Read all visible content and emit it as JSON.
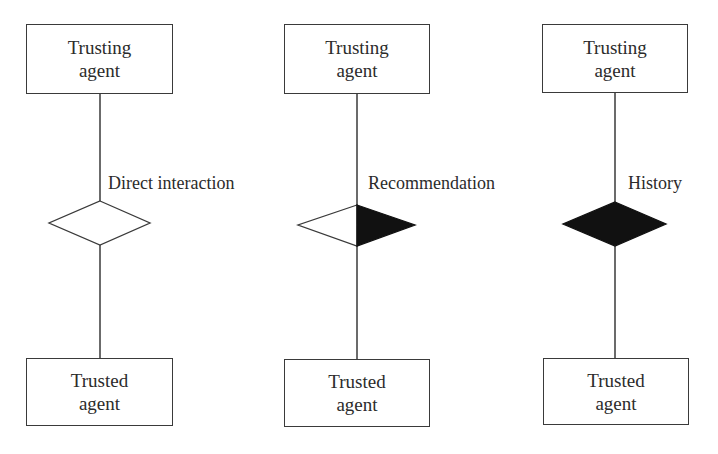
{
  "diagram": {
    "columns": [
      {
        "id": "direct",
        "top_box": {
          "line1": "Trusting",
          "line2": "agent"
        },
        "bottom_box": {
          "line1": "Trusted",
          "line2": "agent"
        },
        "relation_label": "Direct interaction",
        "diamond_fill": "empty"
      },
      {
        "id": "recommendation",
        "top_box": {
          "line1": "Trusting",
          "line2": "agent"
        },
        "bottom_box": {
          "line1": "Trusted",
          "line2": "agent"
        },
        "relation_label": "Recommendation",
        "diamond_fill": "right-half-filled"
      },
      {
        "id": "history",
        "top_box": {
          "line1": "Trusting",
          "line2": "agent"
        },
        "bottom_box": {
          "line1": "Trusted",
          "line2": "agent"
        },
        "relation_label": "History",
        "diamond_fill": "filled"
      }
    ],
    "colors": {
      "stroke": "#3a3a3a",
      "fill": "#111111",
      "background": "#ffffff"
    }
  }
}
